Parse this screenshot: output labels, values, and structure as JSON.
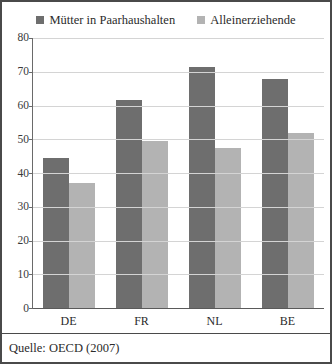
{
  "chart_data": {
    "type": "bar",
    "title": "",
    "subtitle": "",
    "xlabel": "",
    "ylabel": "",
    "categories": [
      "DE",
      "FR",
      "NL",
      "BE"
    ],
    "series": [
      {
        "name": "Mütter in Paarhaushalten",
        "color": "#6e6e6e",
        "values": [
          44.5,
          61.5,
          71.5,
          68.0
        ]
      },
      {
        "name": "Alleinerziehende",
        "color": "#b3b3b3",
        "values": [
          37.0,
          49.5,
          47.5,
          52.0
        ]
      }
    ],
    "ylim": [
      0,
      80
    ],
    "yticks": [
      0,
      10,
      20,
      30,
      40,
      50,
      60,
      70,
      80
    ],
    "ytick_labels": [
      "0",
      "10",
      "20",
      "30",
      "40",
      "50",
      "60",
      "70",
      "80"
    ],
    "grid": true,
    "legend_position": "top",
    "source_note": "Quelle: OECD (2007)"
  },
  "legend": {
    "items": [
      {
        "label": "Mütter in Paarhaushalten",
        "swatch": "legend-swatch-dark"
      },
      {
        "label": "Alleinerziehende",
        "swatch": "legend-swatch-light"
      }
    ]
  },
  "footer": {
    "source": "Quelle: OECD (2007)"
  }
}
